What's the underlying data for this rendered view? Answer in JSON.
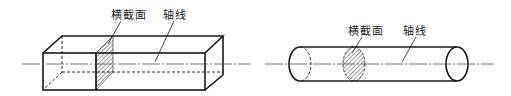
{
  "figures": [
    {
      "id": "rectangular-bar",
      "labels": {
        "cross_section": "横截面",
        "axis": "轴线"
      }
    },
    {
      "id": "cylindrical-bar",
      "labels": {
        "cross_section": "横截面",
        "axis": "轴线"
      }
    }
  ],
  "colors": {
    "line": "#1a1a1a",
    "axis": "#555555"
  }
}
